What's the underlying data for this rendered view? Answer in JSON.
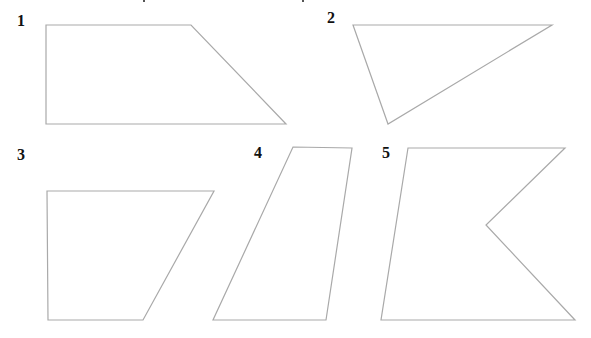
{
  "figure": {
    "width": 591,
    "height": 338,
    "stroke_color": "#a9a9a9",
    "label_color": "#111111",
    "shapes": [
      {
        "id": "1",
        "label": "1",
        "label_pos": [
          17,
          26
        ],
        "kind": "trapezoid",
        "points": "46,25 191,25 286,124 46,124"
      },
      {
        "id": "2",
        "label": "2",
        "label_pos": [
          327,
          23
        ],
        "kind": "triangle",
        "points": "353,25 552,25 388,124"
      },
      {
        "id": "3",
        "label": "3",
        "label_pos": [
          17,
          160
        ],
        "kind": "trapezoid",
        "points": "47,191 214,191 143,320 48,320"
      },
      {
        "id": "4",
        "label": "4",
        "label_pos": [
          254,
          158
        ],
        "kind": "quadrilateral",
        "points": "293,147 352,148 326,320 213,320"
      },
      {
        "id": "5",
        "label": "5",
        "label_pos": [
          382,
          158
        ],
        "kind": "pentagon-concave",
        "points": "408,148 565,148 486,225 575,320 381,320"
      }
    ]
  }
}
